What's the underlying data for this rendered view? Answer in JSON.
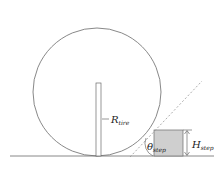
{
  "diagram": {
    "labels": {
      "radius": {
        "main": "R",
        "sub": "tire"
      },
      "angle": {
        "main": "θ",
        "sub": "step"
      },
      "height": {
        "main": "H",
        "sub": "step"
      }
    },
    "colors": {
      "stroke": "#6a6a6a",
      "step_fill": "#cfcfcf",
      "dashed": "#8a8a8a",
      "background": "#ffffff"
    },
    "geometry": {
      "tire_center": [
        97,
        92
      ],
      "tire_radius": 64,
      "ground_y": 156,
      "step_rect": {
        "x": 154,
        "y": 130,
        "w": 29,
        "h": 26
      }
    }
  }
}
